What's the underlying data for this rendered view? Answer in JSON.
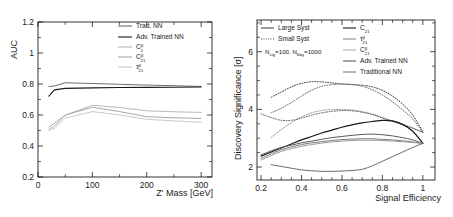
{
  "figure": {
    "panels": [
      "auc-vs-mass",
      "significance-vs-efficiency"
    ]
  },
  "chart_data": [
    {
      "id": "auc-vs-mass",
      "type": "line",
      "title": "",
      "xlabel": "Z' Mass [GeV]",
      "ylabel": "AUC",
      "xlim": [
        0,
        320
      ],
      "ylim": [
        0.2,
        1.2
      ],
      "xticks": [
        0,
        100,
        200,
        300
      ],
      "xtick_labels": [
        "0",
        "100",
        "200",
        "300"
      ],
      "yticks": [
        0.2,
        0.4,
        0.6,
        0.8,
        1,
        1.2
      ],
      "ytick_labels": [
        "0.2",
        "0.4",
        "0.6",
        "0.8",
        "1",
        "1.2"
      ],
      "grid": false,
      "legend_position": "top-right",
      "x": [
        20,
        30,
        50,
        100,
        150,
        200,
        250,
        300
      ],
      "series": [
        {
          "name": "Trad. NN",
          "label": "Trad. NN",
          "color": "#6f6f6f",
          "style": "solid",
          "width": 1.0,
          "values": [
            0.783,
            0.787,
            0.808,
            0.803,
            0.798,
            0.793,
            0.789,
            0.784
          ]
        },
        {
          "name": "Adv. Trained NN",
          "label": "Adv. Trained NN",
          "color": "#1a1a1a",
          "style": "solid",
          "width": 1.1,
          "values": [
            0.722,
            0.762,
            0.772,
            0.775,
            0.777,
            0.778,
            0.779,
            0.781
          ]
        },
        {
          "name": "C2beta",
          "label": "C",
          "label_sub": "2",
          "label_sup": "β",
          "color": "#b9b9b9",
          "style": "solid",
          "width": 1.0,
          "values": [
            0.508,
            0.527,
            0.598,
            0.663,
            0.648,
            0.627,
            0.621,
            0.617
          ]
        },
        {
          "name": "C2beta21",
          "label": "C",
          "label_sub": "21",
          "label_sup": "β",
          "color": "#a8a8a8",
          "style": "solid",
          "width": 1.0,
          "values": [
            0.522,
            0.545,
            0.6,
            0.65,
            0.622,
            0.589,
            0.582,
            0.578
          ]
        },
        {
          "name": "tau21beta",
          "label": "τ",
          "label_sub": "21",
          "label_sup": "β",
          "color": "#c9c9c9",
          "style": "solid",
          "width": 1.0,
          "values": [
            0.499,
            0.515,
            0.58,
            0.622,
            0.6,
            0.572,
            0.562,
            0.553
          ]
        }
      ]
    },
    {
      "id": "significance-vs-efficiency",
      "type": "line",
      "title": "",
      "xlabel": "Signal Efficiency",
      "ylabel": "Discovery Significance [σ]",
      "xlim": [
        0.18,
        1.06
      ],
      "ylim": [
        1.55,
        7.1
      ],
      "xticks": [
        0.2,
        0.4,
        0.6,
        0.8,
        1
      ],
      "xtick_labels": [
        "0.2",
        "0.4",
        "0.6",
        "0.8",
        "1"
      ],
      "yticks": [
        2,
        4,
        6
      ],
      "ytick_labels": [
        "2",
        "4",
        "6"
      ],
      "grid": false,
      "legend_position": "top",
      "annotation": "N_sig=100, N_bkg=1000",
      "legend_groups": [
        {
          "label": "Large Syst",
          "style": "solid",
          "color": "#4a4a4a"
        },
        {
          "label": "Small Syst",
          "style": "dotted",
          "color": "#4a4a4a"
        }
      ],
      "legend_entries": [
        {
          "label": "C",
          "label_sub": "21",
          "label_sup": "",
          "color": "#1a1a1a"
        },
        {
          "label": "τ",
          "label_sub": "21",
          "label_sup": "β",
          "color": "#8a8a8a"
        },
        {
          "label": "C",
          "label_sub": "21",
          "label_sup": "β",
          "color": "#b4b4b4"
        },
        {
          "label": "Adv. Trained NN",
          "label_sub": "",
          "label_sup": "",
          "color": "#5a5a5a"
        },
        {
          "label": "Traditional NN",
          "label_sub": "",
          "label_sup": "",
          "color": "#7a7a7a"
        }
      ],
      "annotation_parts": {
        "n_sig_symbol": "N",
        "n_sig_sub": "sig",
        "n_sig_value": "=100,",
        "n_bkg_symbol": "N",
        "n_bkg_sub": "bkg",
        "n_bkg_value": "=1000"
      },
      "x": [
        0.2,
        0.25,
        0.3,
        0.35,
        0.4,
        0.45,
        0.5,
        0.55,
        0.6,
        0.65,
        0.7,
        0.75,
        0.8,
        0.85,
        0.9,
        0.95,
        1.0
      ],
      "series": [
        {
          "name": "Small Syst - Adv. Trained NN",
          "style": "dotted",
          "color": "#3a3a3a",
          "width": 1.0,
          "values": [
            null,
            4.42,
            4.6,
            4.78,
            4.9,
            4.96,
            4.95,
            4.92,
            4.88,
            4.86,
            4.84,
            4.78,
            4.66,
            4.46,
            4.18,
            3.8,
            3.22
          ]
        },
        {
          "name": "Small Syst - Traditional NN",
          "style": "dotted",
          "color": "#6a6a6a",
          "width": 1.0,
          "values": [
            null,
            3.88,
            4.04,
            4.24,
            4.46,
            4.66,
            4.8,
            4.86,
            4.88,
            4.86,
            4.8,
            4.68,
            4.5,
            4.26,
            3.98,
            3.66,
            3.2
          ]
        },
        {
          "name": "Small Syst - C21 beta",
          "style": "dotted",
          "color": "#8a8a8a",
          "width": 1.0,
          "values": [
            null,
            3.02,
            3.3,
            3.54,
            3.74,
            3.88,
            3.96,
            3.99,
            4.0,
            3.98,
            3.92,
            3.84,
            3.72,
            3.6,
            3.48,
            3.36,
            3.2
          ]
        },
        {
          "name": "Small Syst - tau21",
          "style": "dotted",
          "color": "#5a5a5a",
          "width": 1.0,
          "values": [
            3.84,
            3.72,
            3.62,
            3.62,
            3.7,
            3.8,
            3.88,
            3.93,
            3.96,
            3.95,
            3.9,
            3.82,
            3.7,
            3.58,
            3.46,
            3.34,
            3.2
          ]
        },
        {
          "name": "Large Syst - Adv. Trained NN",
          "style": "solid",
          "color": "#1a1a1a",
          "width": 1.2,
          "values": [
            2.38,
            2.52,
            2.66,
            2.8,
            2.94,
            3.06,
            3.18,
            3.28,
            3.38,
            3.46,
            3.53,
            3.58,
            3.62,
            3.6,
            3.48,
            3.24,
            2.82
          ]
        },
        {
          "name": "Large Syst - Traditional NN",
          "style": "solid",
          "color": "#5a5a5a",
          "width": 1.0,
          "values": [
            2.42,
            2.56,
            2.68,
            2.76,
            2.84,
            2.9,
            2.96,
            3.02,
            3.06,
            3.1,
            3.13,
            3.14,
            3.12,
            3.08,
            3.02,
            2.94,
            2.82
          ]
        },
        {
          "name": "Large Syst - C21",
          "style": "solid",
          "color": "#7a7a7a",
          "width": 1.0,
          "values": [
            2.3,
            2.46,
            2.6,
            2.7,
            2.78,
            2.84,
            2.88,
            2.92,
            2.95,
            2.97,
            2.98,
            2.98,
            2.96,
            2.94,
            2.91,
            2.87,
            2.82
          ]
        },
        {
          "name": "Large Syst - C21 beta",
          "style": "solid",
          "color": "#9a9a9a",
          "width": 1.0,
          "values": [
            2.24,
            2.4,
            2.54,
            2.64,
            2.72,
            2.78,
            2.83,
            2.87,
            2.9,
            2.92,
            2.93,
            2.93,
            2.92,
            2.9,
            2.88,
            2.85,
            2.82
          ]
        },
        {
          "name": "Large Syst - tau21",
          "style": "solid",
          "color": "#6a6a6a",
          "width": 1.0,
          "values": [
            null,
            2.08,
            2.02,
            1.96,
            1.9,
            1.87,
            1.85,
            1.85,
            1.86,
            1.88,
            1.92,
            2.04,
            2.2,
            2.36,
            2.52,
            2.68,
            2.82
          ]
        }
      ]
    }
  ]
}
